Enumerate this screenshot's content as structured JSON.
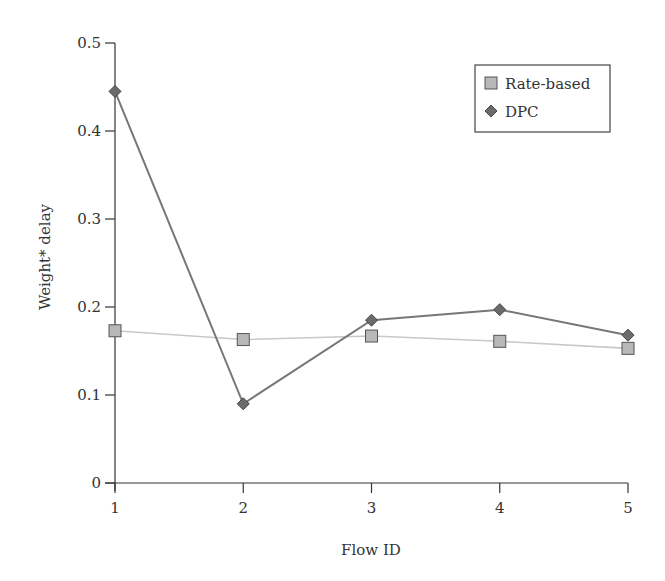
{
  "chart_data": {
    "type": "line",
    "title": "",
    "xlabel": "Flow ID",
    "ylabel": "Weight* delay",
    "x": [
      1,
      2,
      3,
      4,
      5
    ],
    "xticks": [
      "1",
      "2",
      "3",
      "4",
      "5"
    ],
    "yticks": [
      "0",
      "0.1",
      "0.2",
      "0.3",
      "0.4",
      "0.5"
    ],
    "ylim": [
      0,
      0.5
    ],
    "xlim": [
      1,
      5
    ],
    "grid": false,
    "legend_position": "upper right",
    "series": [
      {
        "name": "Rate-based",
        "marker": "square",
        "color": "#b8b8b8",
        "line_color": "#c8c8c8",
        "values": [
          0.173,
          0.163,
          0.167,
          0.161,
          0.153
        ]
      },
      {
        "name": "DPC",
        "marker": "diamond",
        "color": "#6b6b6b",
        "line_color": "#777777",
        "values": [
          0.445,
          0.09,
          0.185,
          0.197,
          0.168
        ]
      }
    ]
  }
}
